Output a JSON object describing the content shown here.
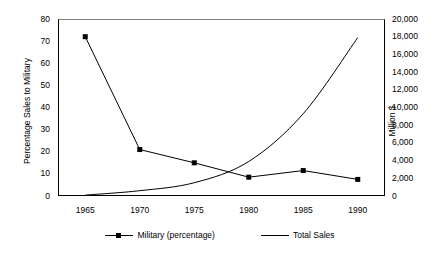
{
  "chart_data": {
    "type": "line",
    "title": "",
    "xlabel": "",
    "ylabel": "Percentage Sales to Military",
    "y2label": "Million $",
    "x": [
      1965,
      1970,
      1975,
      1980,
      1985,
      1990
    ],
    "xlim": [
      1962.5,
      1992.5
    ],
    "ylim": [
      0,
      80
    ],
    "y2lim": [
      0,
      20000
    ],
    "xticks": [
      "1965",
      "1970",
      "1975",
      "1980",
      "1985",
      "1990"
    ],
    "yticks": [
      "0",
      "10",
      "20",
      "30",
      "40",
      "50",
      "60",
      "70",
      "80"
    ],
    "y2ticks": [
      "0",
      "2,000",
      "4,000",
      "6,000",
      "8,000",
      "10,000",
      "12,000",
      "14,000",
      "16,000",
      "18,000",
      "20,000"
    ],
    "grid": false,
    "legend_position": "bottom",
    "series": [
      {
        "name": "Military (percentage)",
        "axis": "left",
        "marker": "square",
        "color": "#000000",
        "values": [
          72,
          21,
          15,
          8.5,
          11.5,
          7.5
        ]
      },
      {
        "name": "Total Sales",
        "axis": "right",
        "marker": "none",
        "color": "#000000",
        "values": [
          100,
          600,
          1500,
          3900,
          9300,
          17900
        ]
      }
    ]
  },
  "axes": {
    "left_title": "Percentage Sales to Military",
    "right_title": "Million $"
  },
  "legend": {
    "items": [
      {
        "label": "Military (percentage)",
        "marker": "square-marker"
      },
      {
        "label": "Total Sales",
        "marker": "plain-line"
      }
    ]
  }
}
